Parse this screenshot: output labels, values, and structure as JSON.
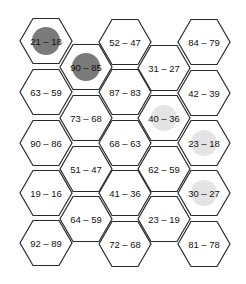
{
  "board": {
    "hex_radius": 26,
    "colors": {
      "stroke": "#2a2a2a",
      "dark_marker": "#7a7a7a",
      "light_marker": "#e4e4e4",
      "text": "#111111"
    },
    "cells": [
      {
        "label": "21 – 18",
        "cx": 46,
        "cy": 41,
        "marker": "dark"
      },
      {
        "label": "63 – 59",
        "cx": 46,
        "cy": 92,
        "marker": "none"
      },
      {
        "label": "90 – 86",
        "cx": 46,
        "cy": 143,
        "marker": "none"
      },
      {
        "label": "19 – 16",
        "cx": 46,
        "cy": 193,
        "marker": "none"
      },
      {
        "label": "92 – 89",
        "cx": 46,
        "cy": 243,
        "marker": "none"
      },
      {
        "label": "90 – 85",
        "cx": 86,
        "cy": 67,
        "marker": "dark"
      },
      {
        "label": "73 – 68",
        "cx": 86,
        "cy": 118,
        "marker": "none"
      },
      {
        "label": "51 – 47",
        "cx": 86,
        "cy": 169,
        "marker": "none"
      },
      {
        "label": "64 – 59",
        "cx": 86,
        "cy": 219,
        "marker": "none"
      },
      {
        "label": "52 – 47",
        "cx": 125,
        "cy": 42,
        "marker": "none"
      },
      {
        "label": "87 – 83",
        "cx": 125,
        "cy": 92,
        "marker": "none"
      },
      {
        "label": "68 – 63",
        "cx": 125,
        "cy": 143,
        "marker": "none"
      },
      {
        "label": "41 – 36",
        "cx": 125,
        "cy": 193,
        "marker": "none"
      },
      {
        "label": "72 – 68",
        "cx": 125,
        "cy": 244,
        "marker": "none"
      },
      {
        "label": "31 – 27",
        "cx": 164,
        "cy": 68,
        "marker": "none"
      },
      {
        "label": "40 – 36",
        "cx": 164,
        "cy": 118,
        "marker": "light"
      },
      {
        "label": "62 – 59",
        "cx": 164,
        "cy": 169,
        "marker": "none"
      },
      {
        "label": "23 – 19",
        "cx": 164,
        "cy": 219,
        "marker": "none"
      },
      {
        "label": "84 – 79",
        "cx": 204,
        "cy": 42,
        "marker": "none"
      },
      {
        "label": "42 – 39",
        "cx": 204,
        "cy": 93,
        "marker": "none"
      },
      {
        "label": "23 – 18",
        "cx": 204,
        "cy": 143,
        "marker": "light"
      },
      {
        "label": "30 – 27",
        "cx": 204,
        "cy": 193,
        "marker": "light"
      },
      {
        "label": "81 – 78",
        "cx": 204,
        "cy": 244,
        "marker": "none"
      }
    ]
  }
}
